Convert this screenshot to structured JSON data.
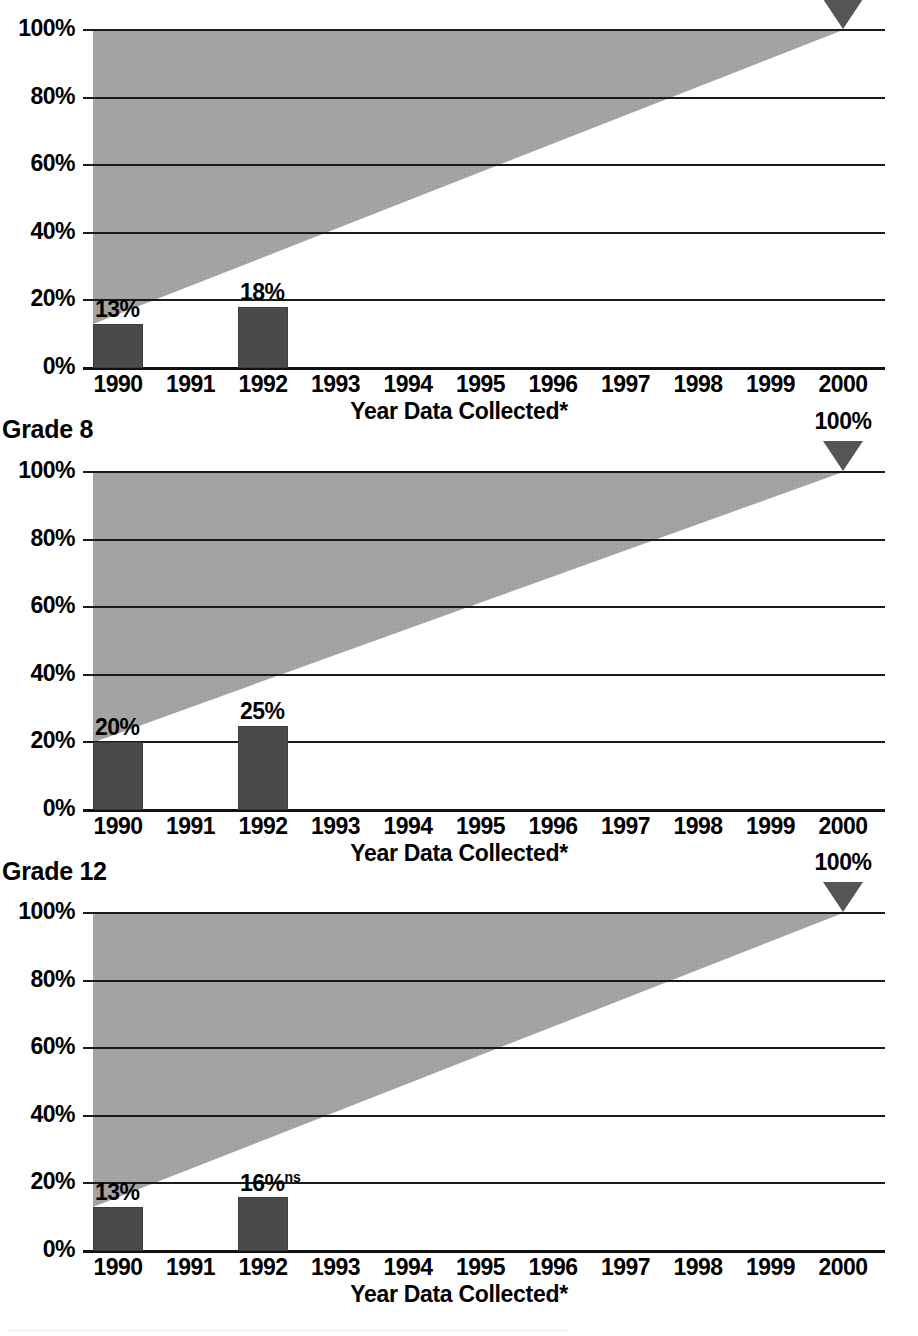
{
  "figure": {
    "shared": {
      "xlabel": "Year Data Collected*",
      "ytick_labels": [
        "100%",
        "80%",
        "60%",
        "40%",
        "20%",
        "0%"
      ],
      "xtick_labels": [
        "1990",
        "1991",
        "1992",
        "1993",
        "1994",
        "1995",
        "1996",
        "1997",
        "1998",
        "1999",
        "2000"
      ],
      "goal_label": "100%",
      "goal_marker_icon": "down-triangle-icon",
      "colors": {
        "bar": "#4a4a4a",
        "trend_band": "#a3a3a3",
        "axis": "#1a1a1a",
        "marker": "#555555"
      }
    },
    "panels": [
      {
        "title": "",
        "title_visible": false,
        "cropped_top": true,
        "bars": [
          {
            "year": "1990",
            "value": 13,
            "label": "13%",
            "sig": ""
          },
          {
            "year": "1992",
            "value": 18,
            "label": "18%",
            "sig": ""
          }
        ],
        "goal": {
          "year": "2000",
          "value": 100,
          "label": "100%"
        },
        "trend_start": 13,
        "trend_end": 100
      },
      {
        "title": "Grade 8",
        "title_visible": true,
        "cropped_top": false,
        "bars": [
          {
            "year": "1990",
            "value": 20,
            "label": "20%",
            "sig": ""
          },
          {
            "year": "1992",
            "value": 25,
            "label": "25%",
            "sig": ""
          }
        ],
        "goal": {
          "year": "2000",
          "value": 100,
          "label": "100%"
        },
        "trend_start": 20,
        "trend_end": 100
      },
      {
        "title": "Grade 12",
        "title_visible": true,
        "cropped_top": false,
        "bars": [
          {
            "year": "1990",
            "value": 13,
            "label": "13%",
            "sig": ""
          },
          {
            "year": "1992",
            "value": 16,
            "label": "16%",
            "sig": "ns"
          }
        ],
        "goal": {
          "year": "2000",
          "value": 100,
          "label": "100%"
        },
        "trend_start": 13,
        "trend_end": 100
      }
    ]
  },
  "chart_data": {
    "type": "bar",
    "xlabel": "Year Data Collected*",
    "ylabel": "",
    "ylim": [
      0,
      100
    ],
    "yticks": [
      0,
      20,
      40,
      60,
      80,
      100
    ],
    "ytick_labels": [
      "0%",
      "20%",
      "40%",
      "60%",
      "80%",
      "100%"
    ],
    "x": [
      "1990",
      "1991",
      "1992",
      "1993",
      "1994",
      "1995",
      "1996",
      "1997",
      "1998",
      "1999",
      "2000"
    ],
    "grid": true,
    "legend": "none",
    "panels": [
      {
        "name": "Grade 4 (partially cropped)",
        "categories": [
          "1990",
          "1992"
        ],
        "values": [
          13,
          18
        ],
        "data_labels": [
          "13%",
          "18%"
        ],
        "goal_value": 100,
        "goal_year": "2000",
        "goal_label": "100%",
        "trend_band": {
          "from": {
            "year": "1990",
            "value": 13
          },
          "to": {
            "year": "2000",
            "value": 100
          }
        }
      },
      {
        "name": "Grade 8",
        "categories": [
          "1990",
          "1992"
        ],
        "values": [
          20,
          25
        ],
        "data_labels": [
          "20%",
          "25%"
        ],
        "goal_value": 100,
        "goal_year": "2000",
        "goal_label": "100%",
        "trend_band": {
          "from": {
            "year": "1990",
            "value": 20
          },
          "to": {
            "year": "2000",
            "value": 100
          }
        }
      },
      {
        "name": "Grade 12",
        "categories": [
          "1990",
          "1992"
        ],
        "values": [
          13,
          16
        ],
        "data_labels": [
          "13%",
          "16%ns"
        ],
        "annotations": [
          "ns = not significant (on 1992 value)"
        ],
        "goal_value": 100,
        "goal_year": "2000",
        "goal_label": "100%",
        "trend_band": {
          "from": {
            "year": "1990",
            "value": 13
          },
          "to": {
            "year": "2000",
            "value": 100
          }
        }
      }
    ]
  }
}
